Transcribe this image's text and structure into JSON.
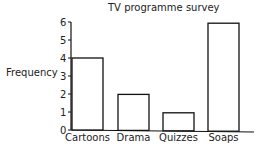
{
  "chart_data": {
    "type": "bar",
    "title": "TV programme survey",
    "xlabel": "",
    "ylabel": "Frequency",
    "categories": [
      "Cartoons",
      "Drama",
      "Quizzes",
      "Soaps"
    ],
    "values": [
      4,
      2,
      1,
      6
    ],
    "ylim": [
      0,
      6
    ],
    "yticks": [
      0,
      1,
      2,
      3,
      4,
      5,
      6
    ],
    "grid": false,
    "legend": null
  }
}
